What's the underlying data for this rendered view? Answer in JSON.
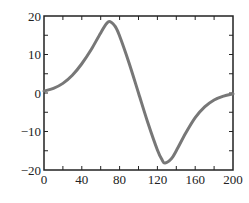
{
  "chart_data": {
    "type": "line",
    "title": "",
    "xlabel": "",
    "ylabel": "",
    "xlim": [
      0,
      200
    ],
    "ylim": [
      -20,
      20
    ],
    "grid": false,
    "legend": null,
    "x_ticks": [
      0,
      40,
      80,
      120,
      160,
      200
    ],
    "x_tick_labels": [
      "0",
      "40",
      "80",
      "120",
      "160",
      "200"
    ],
    "x_minor_ticks": [
      20,
      60,
      100,
      140,
      180
    ],
    "y_ticks": [
      20,
      10,
      0,
      -10,
      -20
    ],
    "y_tick_labels": [
      "20",
      "10",
      "0",
      "−10",
      "−20"
    ],
    "y_minor_ticks": [
      15,
      5,
      -5,
      -15
    ],
    "series": [
      {
        "name": "curve",
        "color": "#777777",
        "x": [
          0,
          10,
          20,
          30,
          40,
          50,
          60,
          68,
          75,
          80,
          90,
          100,
          110,
          120,
          125,
          128,
          135,
          140,
          150,
          160,
          170,
          180,
          190,
          200
        ],
        "y": [
          0.5,
          1.2,
          2.5,
          4.6,
          7.6,
          11.3,
          15.6,
          18.5,
          17.4,
          14.8,
          7.8,
          0.0,
          -7.8,
          -14.8,
          -17.4,
          -18.2,
          -17.0,
          -15.0,
          -10.4,
          -6.4,
          -3.6,
          -1.8,
          -0.8,
          -0.2
        ]
      }
    ]
  }
}
